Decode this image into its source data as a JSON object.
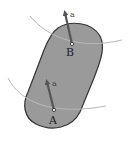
{
  "diagram": {
    "colors": {
      "body_fill": "#9a9a9a",
      "body_stroke": "#333333",
      "path_stroke": "#b8b8b8",
      "arrow": "#444444",
      "text": "#222222"
    },
    "points": [
      {
        "label": "B",
        "vector_label": "a"
      },
      {
        "label": "A",
        "vector_label": "a"
      }
    ]
  }
}
